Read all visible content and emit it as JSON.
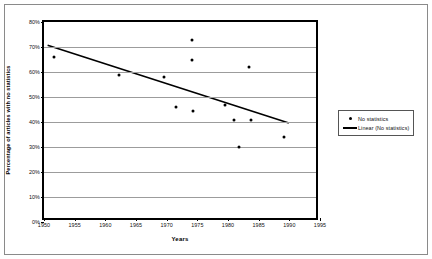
{
  "chart_data": {
    "type": "scatter",
    "title": "",
    "xlabel": "Years",
    "ylabel": "Percentage of articles with no statistics",
    "xlim": [
      1950,
      1995
    ],
    "ylim": [
      0,
      0.8
    ],
    "grid": true,
    "legend_position": "right",
    "xticks": [
      "1950",
      "1955",
      "1960",
      "1965",
      "1970",
      "1975",
      "1980",
      "1985",
      "1990",
      "1995"
    ],
    "xtick_values": [
      1950,
      1955,
      1960,
      1965,
      1970,
      1975,
      1980,
      1985,
      1990,
      1995
    ],
    "yticks": [
      "0%",
      "10%",
      "20%",
      "30%",
      "40%",
      "50%",
      "60%",
      "70%",
      "80%"
    ],
    "ytick_values": [
      0,
      10,
      20,
      30,
      40,
      50,
      60,
      70,
      80
    ],
    "series": [
      {
        "name": "No statistics",
        "type": "scatter",
        "marker": "filled-circle",
        "color": "#000000",
        "points": [
          {
            "x": 1951.6,
            "y": 66
          },
          {
            "x": 1962.2,
            "y": 59
          },
          {
            "x": 1969.6,
            "y": 58
          },
          {
            "x": 1971.5,
            "y": 46
          },
          {
            "x": 1974.3,
            "y": 44.5
          },
          {
            "x": 1974.2,
            "y": 73
          },
          {
            "x": 1974.2,
            "y": 65
          },
          {
            "x": 1979.5,
            "y": 47
          },
          {
            "x": 1981.0,
            "y": 41
          },
          {
            "x": 1983.7,
            "y": 41
          },
          {
            "x": 1983.5,
            "y": 62
          },
          {
            "x": 1981.8,
            "y": 30
          },
          {
            "x": 1989.2,
            "y": 34
          }
        ]
      },
      {
        "name": "Linear (No statistics)",
        "type": "line",
        "color": "#000000",
        "endpoints": [
          {
            "x": 1950.6,
            "y": 70.5
          },
          {
            "x": 1990.5,
            "y": 38.8
          }
        ]
      }
    ]
  },
  "legend": {
    "items": [
      {
        "label": "No statistics",
        "key": "marker"
      },
      {
        "label": "Linear (No statistics)",
        "key": "line"
      }
    ]
  }
}
